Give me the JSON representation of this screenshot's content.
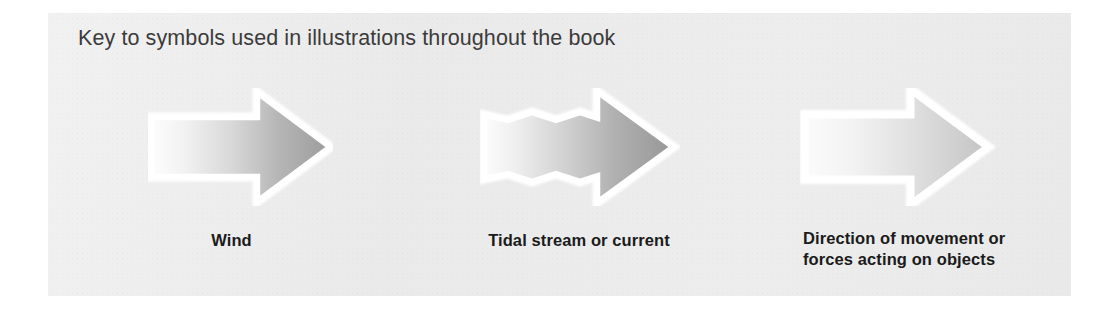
{
  "panel": {
    "title": "Key to symbols used in illustrations throughout the book",
    "background_color": "#ededed",
    "text_color": "#3b3b3b"
  },
  "symbols": [
    {
      "icon": "straight-arrow-right-icon",
      "label": "Wind",
      "gradient_from": "#fdfdfd",
      "gradient_to": "#9f9f9f",
      "outline_color": "#ffffff"
    },
    {
      "icon": "wavy-arrow-right-icon",
      "label": "Tidal stream or current",
      "gradient_from": "#fcfcfc",
      "gradient_to": "#9a9a9a",
      "outline_color": "#ffffff"
    },
    {
      "icon": "straight-arrow-right-light-icon",
      "label_line_1": "Direction of movement or",
      "label_line_2": "forces acting on objects",
      "gradient_from": "#fbfbfb",
      "gradient_to": "#c6c6c6",
      "outline_color": "#ffffff"
    }
  ]
}
